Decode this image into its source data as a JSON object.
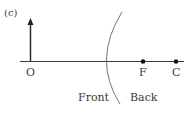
{
  "diagram": {
    "panel_label": "(c)",
    "object_point_label": "O",
    "focal_point_label": "F",
    "center_label": "C",
    "front_label": "Front",
    "back_label": "Back",
    "elements": {
      "object_arrow": "upright arrow at O",
      "optical_axis": "horizontal line",
      "mirror": "curved (concave toward right) surface",
      "points": [
        "F",
        "C"
      ]
    },
    "colors": {
      "line": "#3a3a3a",
      "mirror": "#777777",
      "text": "#3a3a3a"
    }
  }
}
